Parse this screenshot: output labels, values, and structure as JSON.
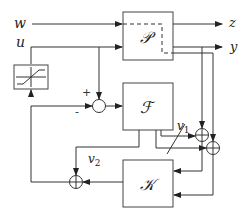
{
  "diagram": {
    "type": "control-block-diagram",
    "blocks": {
      "plant": {
        "label": "𝒫"
      },
      "filter": {
        "label": "ℱ"
      },
      "controller": {
        "label": "𝒦"
      },
      "saturation": {
        "label": "saturation"
      }
    },
    "signals": {
      "w": "w",
      "u": "u",
      "z": "z",
      "y": "y",
      "v1": "v",
      "v1_sub": "1",
      "v2": "v",
      "v2_sub": "2"
    },
    "signs": {
      "plus": "+",
      "minus": "-"
    },
    "colors": {
      "line": "#333333",
      "background": "#ffffff"
    }
  }
}
